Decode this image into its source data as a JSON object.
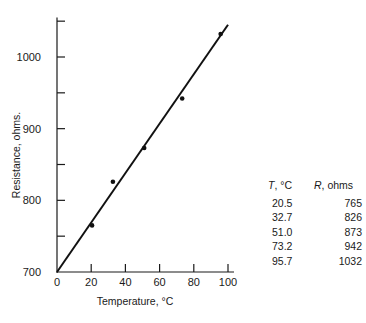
{
  "chart_data": {
    "type": "scatter",
    "title": "",
    "xlabel": "Temperature, °C",
    "ylabel": "Resistance, ohms.",
    "xlim": [
      0,
      100
    ],
    "ylim": [
      700,
      1050
    ],
    "x_ticks": [
      0,
      20,
      40,
      60,
      80,
      100
    ],
    "y_ticks": [
      700,
      800,
      900,
      1000
    ],
    "y_minor_ticks": [
      750,
      850,
      950,
      1050
    ],
    "grid": false,
    "series": [
      {
        "name": "Measured",
        "x": [
          20.5,
          32.7,
          51.0,
          73.2,
          95.7
        ],
        "y": [
          765,
          826,
          873,
          942,
          1032
        ]
      }
    ],
    "fit_line": {
      "x": [
        0,
        100
      ],
      "y": [
        700,
        1045
      ]
    },
    "table": {
      "headers": [
        "T, °C",
        "R, ohms"
      ],
      "rows": [
        [
          "20.5",
          "765"
        ],
        [
          "32.7",
          "826"
        ],
        [
          "51.0",
          "873"
        ],
        [
          "73.2",
          "942"
        ],
        [
          "95.7",
          "1032"
        ]
      ]
    }
  },
  "table": {
    "header_t_var": "T",
    "header_t_unit": ", °C",
    "header_r_var": "R",
    "header_r_unit": ", ohms",
    "rows": [
      {
        "t": "20.5",
        "r": "765"
      },
      {
        "t": "32.7",
        "r": "826"
      },
      {
        "t": "51.0",
        "r": "873"
      },
      {
        "t": "73.2",
        "r": "942"
      },
      {
        "t": "95.7",
        "r": "1032"
      }
    ]
  }
}
